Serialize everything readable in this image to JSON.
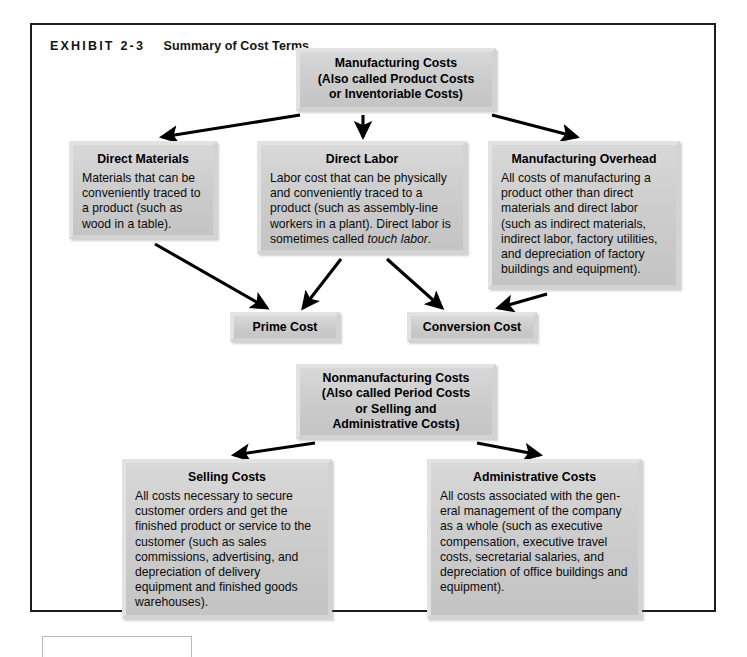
{
  "exhibit": {
    "label": "EXHIBIT 2-3",
    "title": "Summary of Cost Terms"
  },
  "boxes": {
    "manufacturing_costs": {
      "title": "Manufacturing Costs\n(Also called Product Costs\nor Inventoriable Costs)"
    },
    "direct_materials": {
      "title": "Direct Materials",
      "body": "Materials that can be conveniently traced to a product (such as wood in a table)."
    },
    "direct_labor": {
      "title": "Direct Labor",
      "body_part1": "Labor cost that can be physically and conveniently traced to a product (such as assembly-line workers in a plant). Direct labor is sometimes called ",
      "body_italic": "touch labor",
      "body_part2": "."
    },
    "manufacturing_overhead": {
      "title": "Manufacturing Overhead",
      "body": "All costs of manufacturing a product other than direct materials and direct labor (such as indirect materials, indirect labor, factory utilities, and depreciation of factory buildings and equipment)."
    },
    "prime_cost": {
      "title": "Prime Cost"
    },
    "conversion_cost": {
      "title": "Conversion Cost"
    },
    "nonmanufacturing_costs": {
      "title": "Nonmanufacturing Costs\n(Also called Period Costs\nor Selling and\nAdministrative Costs)"
    },
    "selling_costs": {
      "title": "Selling Costs",
      "body": "All costs necessary to secure customer orders and get the finished product or service to the customer (such as sales commissions, advertising, and depreciation of delivery equipment and finished goods warehouses)."
    },
    "administrative_costs": {
      "title": "Administrative Costs",
      "body": "All costs associated with the gen-eral management of the company as a whole (such as executive compensation, executive travel costs, secretarial salaries, and depreciation of office buildings and equipment)."
    }
  },
  "colors": {
    "box_fill": "#cfcfcf",
    "box_frame": "#e2e2e2",
    "arrow": "#000000",
    "border": "#1c1c1c"
  },
  "flows": [
    {
      "from": "manufacturing_costs",
      "to": "direct_materials"
    },
    {
      "from": "manufacturing_costs",
      "to": "direct_labor"
    },
    {
      "from": "manufacturing_costs",
      "to": "manufacturing_overhead"
    },
    {
      "from": "direct_materials",
      "to": "prime_cost"
    },
    {
      "from": "direct_labor",
      "to": "prime_cost"
    },
    {
      "from": "direct_labor",
      "to": "conversion_cost"
    },
    {
      "from": "manufacturing_overhead",
      "to": "conversion_cost"
    },
    {
      "from": "nonmanufacturing_costs",
      "to": "selling_costs"
    },
    {
      "from": "nonmanufacturing_costs",
      "to": "administrative_costs"
    }
  ]
}
